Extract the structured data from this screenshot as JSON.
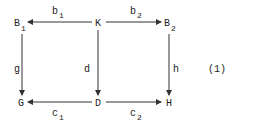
{
  "diagram": {
    "type": "commutative-diagram",
    "equation_label": "(1)",
    "nodes": {
      "B1": {
        "base": "B",
        "sub": "1"
      },
      "K": {
        "base": "K",
        "sub": ""
      },
      "B2": {
        "base": "B",
        "sub": "2"
      },
      "G": {
        "base": "G",
        "sub": ""
      },
      "D": {
        "base": "D",
        "sub": ""
      },
      "H": {
        "base": "H",
        "sub": ""
      }
    },
    "arrows": {
      "b1": {
        "from": "K",
        "to": "B1",
        "base": "b",
        "sub": "1"
      },
      "b2": {
        "from": "K",
        "to": "B2",
        "base": "b",
        "sub": "2"
      },
      "g": {
        "from": "B1",
        "to": "G",
        "base": "g",
        "sub": ""
      },
      "d": {
        "from": "K",
        "to": "D",
        "base": "d",
        "sub": ""
      },
      "h": {
        "from": "B2",
        "to": "H",
        "base": "h",
        "sub": ""
      },
      "c1": {
        "from": "D",
        "to": "G",
        "base": "c",
        "sub": "1"
      },
      "c2": {
        "from": "D",
        "to": "H",
        "base": "c",
        "sub": "2"
      }
    },
    "colors": {
      "line": "#333333",
      "text": "#222222",
      "background": "#ffffff"
    }
  }
}
